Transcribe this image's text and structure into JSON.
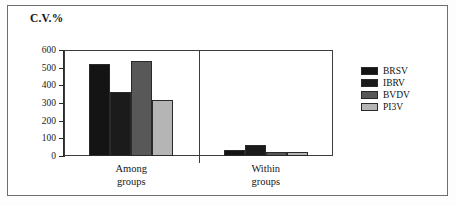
{
  "figure": {
    "background": "#ffffff",
    "frame_color": "#6e6e6e"
  },
  "chart_data": {
    "type": "bar",
    "title": "C.V.%",
    "xlabel": "",
    "ylabel": "",
    "ylim": [
      0,
      600
    ],
    "ytick_step": 100,
    "yticks": [
      600,
      500,
      400,
      300,
      200,
      100,
      0
    ],
    "grid": true,
    "legend_position": "right",
    "categories": [
      "Among groups",
      "Within groups"
    ],
    "category_lines": [
      [
        "Among",
        "groups"
      ],
      [
        "Within",
        "groups"
      ]
    ],
    "series": [
      {
        "name": "BRSV",
        "color": "#141414",
        "values": [
          520,
          35
        ]
      },
      {
        "name": "IBRV",
        "color": "#1b1b1b",
        "values": [
          360,
          60
        ]
      },
      {
        "name": "BVDV",
        "color": "#585858",
        "values": [
          540,
          25
        ]
      },
      {
        "name": "PI3V",
        "color": "#b5b5b5",
        "values": [
          315,
          25
        ]
      }
    ]
  }
}
